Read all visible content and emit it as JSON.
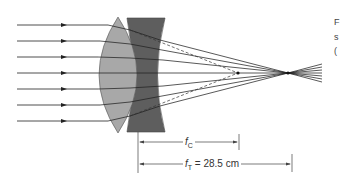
{
  "diagram": {
    "colors": {
      "converging_lens": "#a8a8a8",
      "diverging_lens": "#5e5e5e",
      "ray": "#222222",
      "background": "#ffffff"
    },
    "incoming_rays_y": [
      25,
      41,
      57,
      73,
      89,
      105,
      121
    ],
    "focal_point_converging": {
      "x": 238,
      "y": 73
    },
    "focal_point_total": {
      "x": 288,
      "y": 73
    },
    "labels": {
      "fc_symbol": "f",
      "fc_sub": "C",
      "ft_symbol": "f",
      "ft_sub": "T",
      "ft_value": " = 28.5 cm"
    },
    "edge_text": [
      "F",
      "s",
      "("
    ]
  }
}
